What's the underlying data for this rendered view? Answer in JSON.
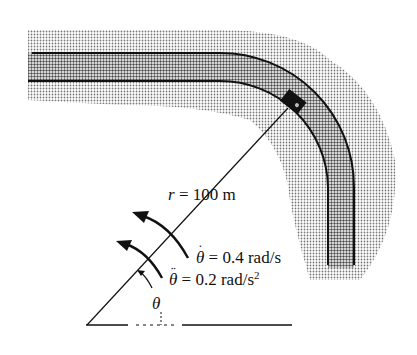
{
  "diagram": {
    "type": "curved-road-polar-kinematics",
    "labels": {
      "radius": {
        "symbol": "r",
        "eq": "=",
        "value": "100 m"
      },
      "angular_velocity": {
        "symbol": "θ",
        "dots": "˙",
        "eq": "=",
        "value": "0.4 rad/s"
      },
      "angular_acceleration": {
        "symbol": "θ",
        "dots": "¨",
        "eq": "=",
        "value": "0.2 rad/s",
        "exponent": "2"
      },
      "angle": {
        "symbol": "θ"
      }
    },
    "colors": {
      "ink": "#111111",
      "shade": "#9a9a9a",
      "road": "#c8c8c8"
    }
  }
}
